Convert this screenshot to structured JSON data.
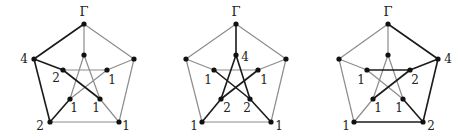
{
  "colors": {
    "dark_edge": "#1a1a1a",
    "light_edge": "#8c8c8c",
    "vertex": "#111111",
    "background": "#ffffff"
  },
  "root_label": "Γ",
  "vertex_names": [
    "outer_top",
    "outer_left",
    "outer_right",
    "outer_bottom_left",
    "outer_bottom_right",
    "inner_top",
    "inner_left",
    "inner_right",
    "inner_bottom_left",
    "inner_bottom_right"
  ],
  "edges": [
    [
      "outer_top",
      "outer_left"
    ],
    [
      "outer_top",
      "outer_right"
    ],
    [
      "outer_left",
      "outer_bottom_left"
    ],
    [
      "outer_right",
      "outer_bottom_right"
    ],
    [
      "outer_bottom_left",
      "outer_bottom_right"
    ],
    [
      "outer_top",
      "inner_top"
    ],
    [
      "outer_left",
      "inner_left"
    ],
    [
      "outer_right",
      "inner_right"
    ],
    [
      "outer_bottom_left",
      "inner_bottom_left"
    ],
    [
      "outer_bottom_right",
      "inner_bottom_right"
    ],
    [
      "inner_top",
      "inner_bottom_left"
    ],
    [
      "inner_top",
      "inner_bottom_right"
    ],
    [
      "inner_left",
      "inner_right"
    ],
    [
      "inner_left",
      "inner_bottom_right"
    ],
    [
      "inner_right",
      "inner_bottom_left"
    ]
  ],
  "graphs": [
    {
      "name": "graph-1",
      "vertices": {
        "outer_top": [
          84,
          24
        ],
        "outer_left": [
          34,
          59
        ],
        "outer_right": [
          134,
          59
        ],
        "outer_bottom_left": [
          50,
          122
        ],
        "outer_bottom_right": [
          119,
          122
        ],
        "inner_top": [
          84,
          55
        ],
        "inner_left": [
          63,
          70
        ],
        "inner_right": [
          107,
          70
        ],
        "inner_bottom_left": [
          70,
          99
        ],
        "inner_bottom_right": [
          100,
          99
        ]
      },
      "dark_edges": [
        [
          0,
          1
        ],
        [
          6,
          13
        ],
        [
          2,
          8
        ]
      ],
      "dark_edge_pairs": [
        [
          "outer_top",
          "outer_left"
        ],
        [
          "outer_left",
          "inner_left"
        ],
        [
          "inner_left",
          "inner_bottom_right"
        ],
        [
          "outer_left",
          "outer_bottom_left"
        ],
        [
          "outer_bottom_left",
          "inner_bottom_left"
        ]
      ],
      "labels": [
        {
          "text": "Γ",
          "x": 84,
          "y": 16,
          "top": true
        },
        {
          "text": "4",
          "x": 24,
          "y": 63
        },
        {
          "text": "2",
          "x": 56,
          "y": 82
        },
        {
          "text": "1",
          "x": 112,
          "y": 84
        },
        {
          "text": "1",
          "x": 74,
          "y": 112
        },
        {
          "text": "1",
          "x": 96,
          "y": 112
        },
        {
          "text": "2",
          "x": 40,
          "y": 130
        },
        {
          "text": "1",
          "x": 126,
          "y": 130
        }
      ]
    },
    {
      "name": "graph-2",
      "vertices": {
        "outer_top": [
          236,
          24
        ],
        "outer_left": [
          186,
          59
        ],
        "outer_right": [
          286,
          59
        ],
        "outer_bottom_left": [
          202,
          122
        ],
        "outer_bottom_right": [
          271,
          122
        ],
        "inner_top": [
          236,
          55
        ],
        "inner_left": [
          214,
          70
        ],
        "inner_right": [
          258,
          70
        ],
        "inner_bottom_left": [
          221,
          99
        ],
        "inner_bottom_right": [
          250,
          99
        ]
      },
      "dark_edge_pairs": [
        [
          "outer_top",
          "inner_top"
        ],
        [
          "inner_top",
          "inner_bottom_left"
        ],
        [
          "inner_top",
          "inner_bottom_right"
        ],
        [
          "outer_bottom_left",
          "inner_bottom_left"
        ],
        [
          "outer_bottom_right",
          "inner_bottom_right"
        ],
        [
          "inner_left",
          "inner_bottom_right"
        ],
        [
          "inner_right",
          "inner_bottom_left"
        ]
      ],
      "labels": [
        {
          "text": "Γ",
          "x": 236,
          "y": 16,
          "top": true
        },
        {
          "text": "4",
          "x": 245,
          "y": 61
        },
        {
          "text": "1",
          "x": 208,
          "y": 84
        },
        {
          "text": "1",
          "x": 264,
          "y": 84
        },
        {
          "text": "2",
          "x": 227,
          "y": 112
        },
        {
          "text": "2",
          "x": 247,
          "y": 112
        },
        {
          "text": "1",
          "x": 194,
          "y": 130
        },
        {
          "text": "1",
          "x": 279,
          "y": 130
        }
      ]
    },
    {
      "name": "graph-3",
      "vertices": {
        "outer_top": [
          388,
          24
        ],
        "outer_left": [
          339,
          59
        ],
        "outer_right": [
          438,
          59
        ],
        "outer_bottom_left": [
          354,
          122
        ],
        "outer_bottom_right": [
          423,
          122
        ],
        "inner_top": [
          388,
          55
        ],
        "inner_left": [
          367,
          70
        ],
        "inner_right": [
          410,
          70
        ],
        "inner_bottom_left": [
          373,
          99
        ],
        "inner_bottom_right": [
          403,
          99
        ]
      },
      "dark_edge_pairs": [
        [
          "outer_top",
          "outer_right"
        ],
        [
          "outer_right",
          "inner_right"
        ],
        [
          "inner_right",
          "inner_bottom_left"
        ],
        [
          "inner_left",
          "inner_right"
        ],
        [
          "outer_right",
          "outer_bottom_right"
        ],
        [
          "outer_bottom_right",
          "inner_bottom_right"
        ],
        [
          "outer_bottom_left",
          "outer_bottom_right"
        ]
      ],
      "labels": [
        {
          "text": "Γ",
          "x": 388,
          "y": 16,
          "top": true
        },
        {
          "text": "4",
          "x": 448,
          "y": 63
        },
        {
          "text": "1",
          "x": 361,
          "y": 84
        },
        {
          "text": "2",
          "x": 415,
          "y": 84
        },
        {
          "text": "1",
          "x": 378,
          "y": 112
        },
        {
          "text": "1",
          "x": 399,
          "y": 112
        },
        {
          "text": "1",
          "x": 346,
          "y": 130
        },
        {
          "text": "2",
          "x": 431,
          "y": 130
        }
      ]
    }
  ]
}
